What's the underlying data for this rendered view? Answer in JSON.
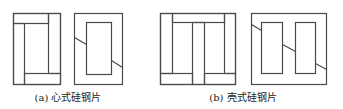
{
  "style": {
    "stroke_color": "#4a4a4a",
    "stroke_width": 1.2,
    "background": "#ffffff"
  },
  "captions": {
    "a": "(a) 心式硅钢片",
    "b": "(b) 壳式硅钢片"
  },
  "figures": [
    {
      "id": "core-type-layer-1",
      "group": "a",
      "rects": [
        {
          "x": 13,
          "y": 13,
          "w": 47,
          "h": 71
        },
        {
          "x": 13,
          "y": 13,
          "w": 35,
          "h": 10
        },
        {
          "x": 13,
          "y": 23,
          "w": 11,
          "h": 61
        },
        {
          "x": 24,
          "y": 73,
          "w": 36,
          "h": 11
        },
        {
          "x": 48,
          "y": 13,
          "w": 12,
          "h": 60
        }
      ],
      "lines": []
    },
    {
      "id": "core-type-layer-2",
      "group": "a",
      "rects": [
        {
          "x": 74,
          "y": 13,
          "w": 48,
          "h": 71
        },
        {
          "x": 86,
          "y": 22,
          "w": 25,
          "h": 52
        }
      ],
      "lines": [
        {
          "x1": 74,
          "y1": 37,
          "x2": 86,
          "y2": 44
        },
        {
          "x1": 111,
          "y1": 60,
          "x2": 122,
          "y2": 67
        }
      ]
    },
    {
      "id": "shell-type-layer-1",
      "group": "b",
      "rects": [
        {
          "x": 160,
          "y": 13,
          "w": 75,
          "h": 71
        },
        {
          "x": 160,
          "y": 13,
          "w": 12,
          "h": 60
        },
        {
          "x": 172,
          "y": 13,
          "w": 52,
          "h": 9
        },
        {
          "x": 224,
          "y": 13,
          "w": 11,
          "h": 60
        },
        {
          "x": 192,
          "y": 22,
          "w": 12,
          "h": 62
        },
        {
          "x": 160,
          "y": 73,
          "w": 32,
          "h": 11
        },
        {
          "x": 204,
          "y": 73,
          "w": 31,
          "h": 11
        }
      ],
      "lines": []
    },
    {
      "id": "shell-type-layer-2",
      "group": "b",
      "rects": [
        {
          "x": 251,
          "y": 13,
          "w": 75,
          "h": 71
        },
        {
          "x": 261,
          "y": 22,
          "w": 21,
          "h": 51
        },
        {
          "x": 295,
          "y": 22,
          "w": 20,
          "h": 51
        }
      ],
      "lines": [
        {
          "x1": 251,
          "y1": 24,
          "x2": 261,
          "y2": 30
        },
        {
          "x1": 282,
          "y1": 44,
          "x2": 295,
          "y2": 51
        },
        {
          "x1": 315,
          "y1": 63,
          "x2": 326,
          "y2": 69
        }
      ]
    }
  ]
}
